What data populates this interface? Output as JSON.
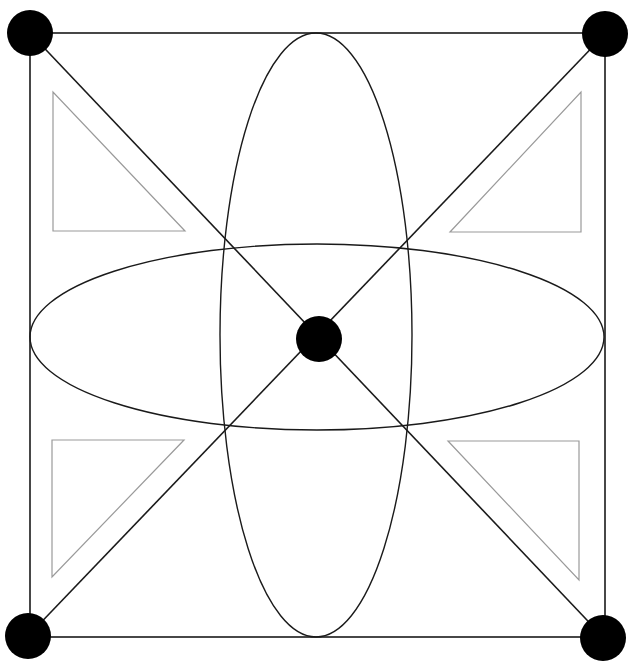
{
  "diagram": {
    "title": "",
    "width": 634,
    "height": 669,
    "colors": {
      "background": "#ffffff",
      "stroke": "#1a1a1a",
      "triangle_stroke": "#9a9a9a",
      "node_fill": "#000000"
    },
    "square": {
      "x1": 30,
      "y1": 33,
      "x2": 605,
      "y2": 637
    },
    "diagonals": [
      {
        "x1": 30,
        "y1": 33,
        "x2": 604,
        "y2": 638
      },
      {
        "x1": 605,
        "y1": 34,
        "x2": 28,
        "y2": 636
      }
    ],
    "ellipses": [
      {
        "name": "vertical-ellipse",
        "cx": 316,
        "cy": 335,
        "rx": 96,
        "ry": 302
      },
      {
        "name": "horizontal-ellipse",
        "cx": 317,
        "cy": 337,
        "rx": 287,
        "ry": 93
      }
    ],
    "triangles": [
      {
        "name": "triangle-top-left",
        "points": "53,92 53,231 185,231"
      },
      {
        "name": "triangle-top-right",
        "points": "581,92 581,232 450,232"
      },
      {
        "name": "triangle-bottom-left",
        "points": "52,440 184,440 52,577"
      },
      {
        "name": "triangle-bottom-right",
        "points": "448,441 579,441 579,580"
      }
    ],
    "nodes": [
      {
        "name": "node-top-left",
        "cx": 30,
        "cy": 33,
        "r": 23
      },
      {
        "name": "node-top-right",
        "cx": 605,
        "cy": 34,
        "r": 23
      },
      {
        "name": "node-bottom-left",
        "cx": 28,
        "cy": 636,
        "r": 23
      },
      {
        "name": "node-bottom-right",
        "cx": 603,
        "cy": 638,
        "r": 23
      },
      {
        "name": "node-center",
        "cx": 319,
        "cy": 339,
        "r": 23
      }
    ]
  }
}
